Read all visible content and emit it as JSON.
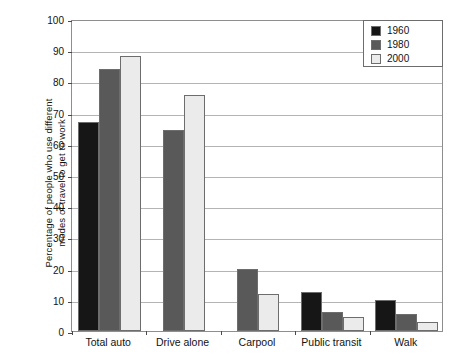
{
  "chart_data": {
    "type": "bar",
    "title": "",
    "subtitle": "",
    "xlabel": "",
    "ylabel": "Percentage of people who use different modes of travel to get to work",
    "ylabel_lines": [
      "Percentage of people who use different",
      "modes of travel to get to work"
    ],
    "categories": [
      "Total auto",
      "Drive alone",
      "Carpool",
      "Public transit",
      "Walk"
    ],
    "series": [
      {
        "name": "1960",
        "color": "#161616",
        "values": [
          67,
          null,
          null,
          12.5,
          10
        ]
      },
      {
        "name": "1980",
        "color": "#595959",
        "values": [
          84,
          64.5,
          19.8,
          6.2,
          5.5
        ]
      },
      {
        "name": "2000",
        "color": "#ebebeb",
        "values": [
          88,
          75.5,
          12,
          4.5,
          3
        ]
      }
    ],
    "ylim": [
      0,
      100
    ],
    "ytick_values": [
      0,
      10,
      20,
      30,
      40,
      50,
      60,
      70,
      80,
      90,
      100
    ],
    "ytick_labels": [
      "0",
      "10",
      "20",
      "30",
      "40",
      "50",
      "60",
      "70",
      "80",
      "90",
      "100"
    ],
    "grid": true,
    "grid_axis": "y",
    "legend_position": "top-right",
    "legend_entries": [
      "1960",
      "1980",
      "2000"
    ],
    "bar_edge_color": "#6d6d6d",
    "axis_color": "#8e8e8e",
    "grid_color": "#b4b4b4"
  }
}
